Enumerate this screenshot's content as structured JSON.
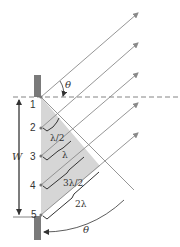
{
  "diagram": {
    "slit_points": [
      "1",
      "2",
      "3",
      "4",
      "5"
    ],
    "width_label": "W",
    "angle_label": "θ",
    "path_differences": [
      "λ/2",
      "λ",
      "3λ/2",
      "2λ"
    ],
    "colors": {
      "ray": "#8a8a8a",
      "wall": "#7a7a7a",
      "shade": "#d4d4d4",
      "dashed": "#666666",
      "text": "#333333",
      "brace": "#333333"
    }
  }
}
